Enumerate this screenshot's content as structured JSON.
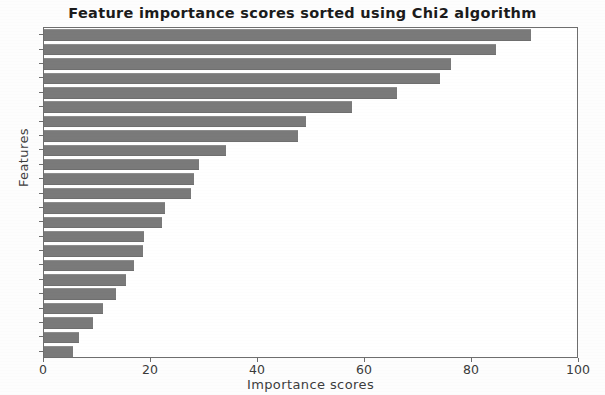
{
  "chart_data": {
    "type": "bar",
    "orientation": "horizontal",
    "title": "Feature importance scores sorted using Chi2 algorithm",
    "xlabel": "Importance scores",
    "ylabel": "Features",
    "xlim": [
      0,
      100
    ],
    "xticks": [
      0,
      20,
      40,
      60,
      80,
      100
    ],
    "xtick_labels": [
      "0",
      "20",
      "40",
      "60",
      "80",
      "100"
    ],
    "grid": false,
    "legend": null,
    "bar_color": "#7a7a7a",
    "categories": [
      "F1",
      "F2",
      "F3",
      "F4",
      "F5",
      "F6",
      "F7",
      "F8",
      "F9",
      "F10",
      "F11",
      "F12",
      "F13",
      "F14",
      "F15",
      "F16",
      "F17",
      "F18",
      "F19",
      "F20",
      "F21",
      "F22",
      "F23"
    ],
    "values": [
      91.0,
      84.5,
      76.0,
      74.0,
      66.0,
      57.5,
      49.0,
      47.5,
      34.0,
      29.0,
      28.0,
      27.5,
      22.6,
      22.0,
      18.7,
      18.5,
      16.8,
      15.3,
      13.5,
      11.0,
      9.2,
      6.5,
      5.4
    ]
  }
}
